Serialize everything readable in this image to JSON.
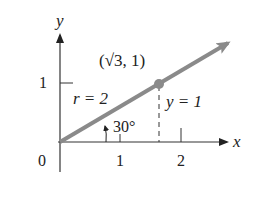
{
  "diagram": {
    "axes": {
      "x_label": "x",
      "y_label": "y",
      "origin_label": "0",
      "x_ticks": [
        "1",
        "2"
      ],
      "y_ticks": [
        "1"
      ]
    },
    "vector": {
      "point_label": "(√3, 1)",
      "radius_label": "r = 2",
      "height_label": "y = 1",
      "angle_label": "30°"
    },
    "colors": {
      "axis": "#333333",
      "vector": "#8a8a8a",
      "point": "#8a8a8a",
      "text": "#222222"
    }
  }
}
